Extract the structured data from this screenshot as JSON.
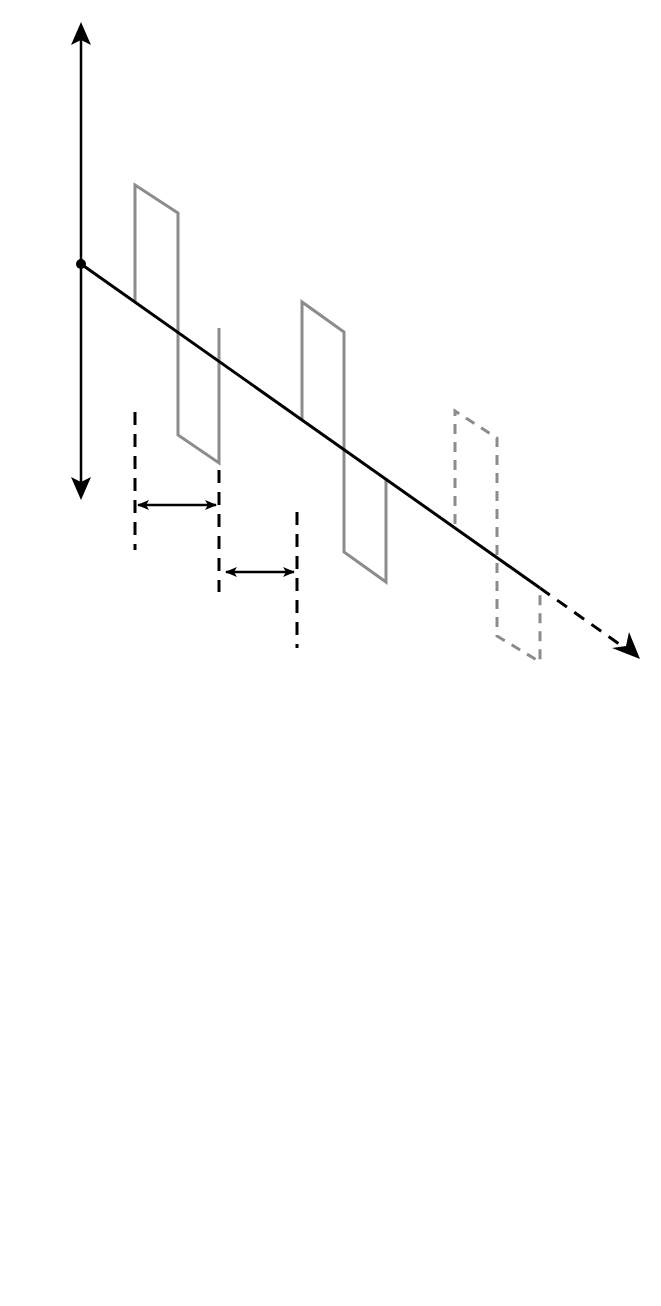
{
  "figure": {
    "type": "stimulation waveform diagram",
    "colors": {
      "axis": "#000000",
      "waveform": "#8c8c8c",
      "background": "#ffffff"
    }
  },
  "panel_a": {
    "label": "A",
    "axis": {
      "plus": "+",
      "zero": "0",
      "minus": "–",
      "time": "t"
    },
    "annotations": {
      "pulse_duration": "PD",
      "interpulse_duration": "IPD"
    },
    "pulses_solid": 2,
    "pulses_dashed": 1
  },
  "panel_b": {
    "label": "B",
    "axis": {
      "plus": "+",
      "zero": "0",
      "minus": "–",
      "time": "t"
    },
    "annotations": {
      "burst_duration": "BuD",
      "interburst_duration": "IBuD"
    },
    "burst_pulses_solid": 5,
    "burst_pulses_dashed": 5
  }
}
